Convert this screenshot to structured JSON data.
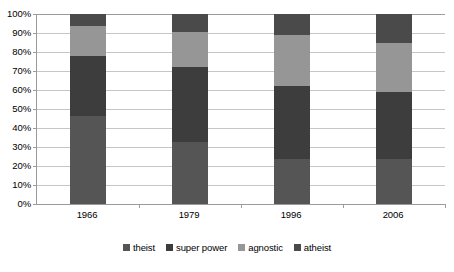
{
  "chart_data": {
    "type": "bar",
    "stacked": true,
    "stack_mode": "percent",
    "title": "",
    "subtitle": "",
    "xlabel": "",
    "ylabel": "",
    "categories": [
      "1966",
      "1979",
      "1996",
      "2006"
    ],
    "ylim": [
      0,
      100
    ],
    "y_ticks": [
      0,
      10,
      20,
      30,
      40,
      50,
      60,
      70,
      80,
      90,
      100
    ],
    "y_tick_labels": [
      "0%",
      "10%",
      "20%",
      "30%",
      "40%",
      "50%",
      "60%",
      "70%",
      "80%",
      "90%",
      "100%"
    ],
    "grid": true,
    "grid_axis": "y",
    "legend_position": "bottom",
    "series": [
      {
        "name": "theist",
        "color": "#555555",
        "values": [
          46.5,
          32.5,
          23.5,
          23.5
        ]
      },
      {
        "name": "super power",
        "color": "#3d3d3d",
        "values": [
          31.5,
          39.5,
          38.5,
          35.5
        ]
      },
      {
        "name": "agnostic",
        "color": "#969696",
        "values": [
          15.5,
          18.5,
          27.0,
          26.0
        ]
      },
      {
        "name": "atheist",
        "color": "#4a4a4a",
        "values": [
          6.5,
          9.5,
          11.0,
          15.0
        ]
      }
    ],
    "cumulative_tops": [
      [
        46.5,
        78.0,
        93.5,
        100.0
      ],
      [
        32.5,
        72.0,
        90.5,
        100.0
      ],
      [
        23.5,
        62.0,
        89.0,
        100.0
      ],
      [
        23.5,
        59.0,
        85.0,
        100.0
      ]
    ],
    "colors": {
      "gridline": "#c6c6c6",
      "axis": "#9b9b9b",
      "background": "#ffffff",
      "text": "#000000"
    }
  },
  "legend": {
    "items": [
      {
        "label": "theist",
        "color": "#555555"
      },
      {
        "label": "super power",
        "color": "#3d3d3d"
      },
      {
        "label": "agnostic",
        "color": "#969696"
      },
      {
        "label": "atheist",
        "color": "#4a4a4a"
      }
    ]
  }
}
